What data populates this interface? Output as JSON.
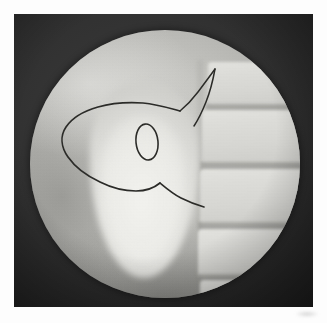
{
  "page": {
    "background_color": "#fdfdfd",
    "width": 327,
    "height": 323
  },
  "photo_panel": {
    "label": "radiographic print",
    "background_color": "#303030",
    "x": 14,
    "y": 14,
    "width": 299,
    "height": 293
  },
  "fluoroscopy_field": {
    "label": "circular fluoroscopic field of view",
    "shape": "circle",
    "center_x": 165,
    "center_y": 164,
    "radius": 135,
    "field_color": "#c4c4c0"
  },
  "anatomy": {
    "contrast_structure": {
      "name": "contrast-filled-organ",
      "description": "bright teardrop / pear-shaped opacity",
      "color": "#eeeeea"
    },
    "spine": {
      "name": "vertebral-column",
      "description": "lateral lumbar vertebral bodies with intervening disc spaces",
      "vertebra_color": "#dcdcd8",
      "disc_color": "#8c8c88",
      "vertebra_count": 5,
      "disc_count": 4
    }
  },
  "annotation": {
    "name": "hand-drawn-ink-marking",
    "ink_color": "#2b2b28",
    "description": "curved outline opening to the left with a small oval inside and a thin line rising to a peak",
    "components": [
      "outer-curve",
      "inner-oval",
      "peak-line"
    ]
  },
  "artifacts": {
    "page_smudge": {
      "name": "faint-page-smudge",
      "color": "#bebebe"
    }
  }
}
